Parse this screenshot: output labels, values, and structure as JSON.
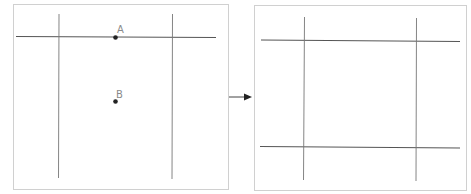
{
  "diagram": {
    "left_panel": {
      "points": [
        {
          "label": "A",
          "x": 115,
          "y": 37
        },
        {
          "label": "B",
          "x": 115,
          "y": 101
        }
      ]
    },
    "arrow": {
      "direction": "right"
    },
    "right_panel": {}
  },
  "colors": {
    "frame": "#d0d0d0",
    "line": "#555555",
    "vline": "#777777",
    "point": "#222222",
    "label": "#8a8a8a"
  }
}
